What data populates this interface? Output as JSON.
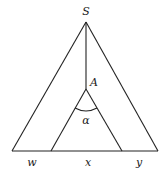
{
  "diagram": {
    "type": "tree",
    "nodes": {
      "root": "S",
      "inner": "A",
      "angle": "α"
    },
    "leaves": [
      "w",
      "x",
      "y"
    ],
    "colors": {
      "stroke": "#222222",
      "background": "#ffffff"
    }
  }
}
